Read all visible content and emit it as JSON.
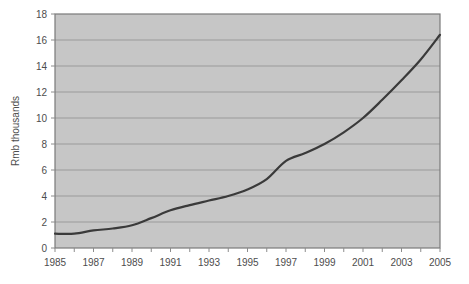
{
  "chart_data": {
    "type": "line",
    "title": "",
    "subtitle": "",
    "xlabel": "",
    "ylabel": "Rmb thousands",
    "xlim": [
      1985,
      2005
    ],
    "ylim": [
      0,
      18
    ],
    "grid": true,
    "legend": false,
    "legend_position": "none",
    "y_ticks": [
      0,
      2,
      4,
      6,
      8,
      10,
      12,
      14,
      16,
      18
    ],
    "y_tick_labels": [
      "0",
      "2",
      "4",
      "6",
      "8",
      "10",
      "12",
      "14",
      "16",
      "18"
    ],
    "x_ticks": [
      1985,
      1986,
      1987,
      1988,
      1989,
      1990,
      1991,
      1992,
      1993,
      1994,
      1995,
      1996,
      1997,
      1998,
      1999,
      2000,
      2001,
      2002,
      2003,
      2004,
      2005
    ],
    "x_tick_labels": [
      "1985",
      "",
      "1987",
      "",
      "1989",
      "",
      "1991",
      "",
      "1993",
      "",
      "1995",
      "",
      "1997",
      "",
      "1999",
      "",
      "2001",
      "",
      "2003",
      "",
      "2005"
    ],
    "x_labels_visible": [
      "1985",
      "1987",
      "1989",
      "1991",
      "1993",
      "1995",
      "1997",
      "1999",
      "2001",
      "2003",
      "2005"
    ],
    "x": [
      1985,
      1986,
      1987,
      1988,
      1989,
      1990,
      1991,
      1992,
      1993,
      1994,
      1995,
      1996,
      1997,
      1998,
      1999,
      2000,
      2001,
      2002,
      2003,
      2004,
      2005
    ],
    "values": [
      1.1,
      1.1,
      1.35,
      1.5,
      1.75,
      2.3,
      2.9,
      3.3,
      3.65,
      4.0,
      4.5,
      5.3,
      6.7,
      7.3,
      8.0,
      8.9,
      10.0,
      11.4,
      12.9,
      14.5,
      16.4
    ],
    "series": [
      {
        "name": "Rmb thousands",
        "color": "#3a3a3a",
        "values": [
          1.1,
          1.1,
          1.35,
          1.5,
          1.75,
          2.3,
          2.9,
          3.3,
          3.65,
          4.0,
          4.5,
          5.3,
          6.7,
          7.3,
          8.0,
          8.9,
          10.0,
          11.4,
          12.9,
          14.5,
          16.4
        ]
      }
    ],
    "colors": {
      "plot_background": "#c6c6c6",
      "grid_line": "#9a9a9a",
      "plot_border": "#7a7a7a",
      "line": "#3a3a3a",
      "tick_text": "#4d4d4d",
      "page_background": "#ffffff"
    }
  }
}
